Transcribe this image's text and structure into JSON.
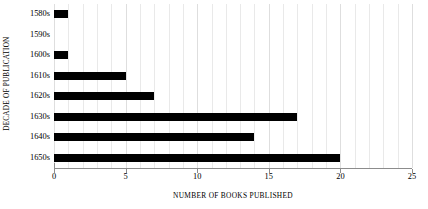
{
  "chart_data": {
    "type": "bar",
    "orientation": "horizontal",
    "title": "",
    "xlabel": "NUMBER OF BOOKS PUBLISHED",
    "ylabel": "DECADE OF PUBLICATION",
    "categories": [
      "1580s",
      "1590s",
      "1600s",
      "1610s",
      "1620s",
      "1630s",
      "1640s",
      "1650s"
    ],
    "values": [
      1,
      0,
      1,
      5,
      7,
      17,
      14,
      20
    ],
    "xlim": [
      0,
      25
    ],
    "xticks": [
      0,
      5,
      10,
      15,
      20,
      25
    ],
    "xtick_labels": [
      "0",
      "5",
      "10",
      "15",
      "20",
      "25"
    ],
    "minor_tick_step": 1,
    "grid": "vertical-minor-and-major",
    "legend": "none",
    "bar_color": "#000000",
    "gridline_color": "#e9e9e9",
    "axis_color": "#8c8c8c",
    "background_color": "#ffffff"
  }
}
